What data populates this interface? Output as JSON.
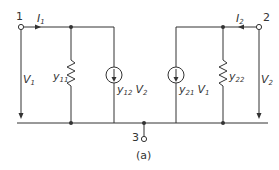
{
  "figure": {
    "caption": "(a)",
    "colors": {
      "line": "#333333",
      "background": "#ffffff"
    }
  },
  "terminals": [
    {
      "id": "1",
      "label": "1"
    },
    {
      "id": "2",
      "label": "2"
    },
    {
      "id": "3",
      "label": "3"
    }
  ],
  "currents": [
    {
      "name": "I",
      "sub": "1",
      "direction": "right"
    },
    {
      "name": "I",
      "sub": "2",
      "direction": "left"
    }
  ],
  "voltages": [
    {
      "name": "V",
      "sub": "1"
    },
    {
      "name": "V",
      "sub": "2"
    }
  ],
  "admittances": [
    {
      "name": "y",
      "sub": "11",
      "type": "resistor"
    },
    {
      "name": "y",
      "sub": "22",
      "type": "resistor"
    }
  ],
  "sources": [
    {
      "coef": "y",
      "coef_sub": "12",
      "var": "V",
      "var_sub": "2",
      "type": "current-source"
    },
    {
      "coef": "y",
      "coef_sub": "21",
      "var": "V",
      "var_sub": "1",
      "type": "current-source"
    }
  ]
}
